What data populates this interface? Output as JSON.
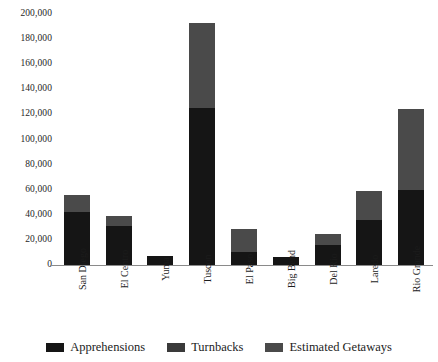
{
  "chart_data": {
    "type": "bar",
    "subtype": "stacked",
    "title": "",
    "xlabel": "",
    "ylabel": "",
    "ylim": [
      0,
      200000
    ],
    "ytick_labels": [
      "200,000",
      "180,000",
      "160,000",
      "140,000",
      "120,000",
      "100,000",
      "80,000",
      "60,000",
      "40,000",
      "20,000",
      "0"
    ],
    "ytick_values": [
      200000,
      180000,
      160000,
      140000,
      120000,
      100000,
      80000,
      60000,
      40000,
      20000,
      0
    ],
    "grid": false,
    "legend_position": "bottom",
    "categories": [
      "San Diego",
      "El Centro",
      "Yuma",
      "Tuscon",
      "El Paso",
      "Big Bend",
      "Del Rio",
      "Laredo",
      "Rio Grande"
    ],
    "series": [
      {
        "name": "Apprehensions",
        "color": "#151515",
        "values": [
          42000,
          31000,
          7000,
          125000,
          10000,
          6000,
          16000,
          36000,
          60000
        ]
      },
      {
        "name": "Turnbacks",
        "color": "#3a3a3a",
        "values": [
          0,
          0,
          0,
          0,
          0,
          0,
          0,
          0,
          0
        ]
      },
      {
        "name": "Estimated Getaways",
        "color": "#4a4a4a",
        "values": [
          14000,
          8000,
          500,
          68000,
          19000,
          500,
          9000,
          23000,
          64000
        ]
      }
    ],
    "totals": [
      56000,
      39000,
      7500,
      193000,
      29000,
      6500,
      25000,
      59000,
      124000
    ]
  },
  "legend": {
    "entries": [
      {
        "label": "Apprehensions",
        "color": "#151515",
        "swatch_name": "legend-swatch-apprehensions"
      },
      {
        "label": "Turnbacks",
        "color": "#3a3a3a",
        "swatch_name": "legend-swatch-turnbacks"
      },
      {
        "label": "Estimated Getaways",
        "color": "#4a4a4a",
        "swatch_name": "legend-swatch-estimated-getaways"
      }
    ]
  }
}
